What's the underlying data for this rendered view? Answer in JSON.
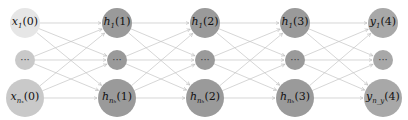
{
  "diagram": {
    "title": "",
    "type": "feed-forward neural network",
    "colors": {
      "input_top": "#e6e6e6",
      "input_mid": "#c9c9c9",
      "input_bottom": "#c9c9c9",
      "hidden": "#9a9a9a",
      "output": "#a8a8a8",
      "edge": "#c4c4c4"
    },
    "layers": [
      {
        "name": "input",
        "nodes": [
          {
            "base": "x",
            "sub": "1",
            "arg": "(0)"
          },
          {
            "dots": "···"
          },
          {
            "base": "x",
            "sub": "nₓ",
            "arg": "(0)"
          }
        ]
      },
      {
        "name": "hidden-1",
        "nodes": [
          {
            "base": "h",
            "sub": "1",
            "arg": "(1)"
          },
          {
            "dots": "···"
          },
          {
            "base": "h",
            "sub": "nₕ",
            "arg": "(1)"
          }
        ]
      },
      {
        "name": "hidden-2",
        "nodes": [
          {
            "base": "h",
            "sub": "1",
            "arg": "(2)"
          },
          {
            "dots": "···"
          },
          {
            "base": "h",
            "sub": "nₕ",
            "arg": "(2)"
          }
        ]
      },
      {
        "name": "hidden-3",
        "nodes": [
          {
            "base": "h",
            "sub": "1",
            "arg": "(3)"
          },
          {
            "dots": "···"
          },
          {
            "base": "h",
            "sub": "nₕ",
            "arg": "(3)"
          }
        ]
      },
      {
        "name": "output",
        "nodes": [
          {
            "base": "y",
            "sub": "1",
            "arg": "(4)"
          },
          {
            "dots": "···"
          },
          {
            "base": "y",
            "sub": "n_y",
            "arg": "(4)"
          }
        ]
      }
    ]
  }
}
